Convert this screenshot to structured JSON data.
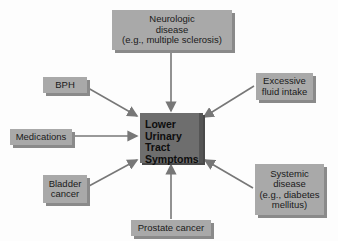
{
  "diagram": {
    "center": {
      "label": "Lower\nUrinary\nTract\nSymptoms"
    },
    "causes": [
      {
        "id": "neurologic",
        "label": "Neurologic\ndisease\n(e.g., multiple sclerosis)"
      },
      {
        "id": "bph",
        "label": "BPH"
      },
      {
        "id": "excessive-fluid",
        "label": "Excessive\nfluid intake"
      },
      {
        "id": "medications",
        "label": "Medications"
      },
      {
        "id": "bladder-cancer",
        "label": "Bladder\ncancer"
      },
      {
        "id": "systemic",
        "label": "Systemic\ndisease\n(e.g., diabetes\nmellitus)"
      },
      {
        "id": "prostate-cancer",
        "label": "Prostate cancer"
      }
    ],
    "colors": {
      "box": "#a9a9a9",
      "center": "#6e6e6e",
      "arrow": "#777777"
    }
  }
}
